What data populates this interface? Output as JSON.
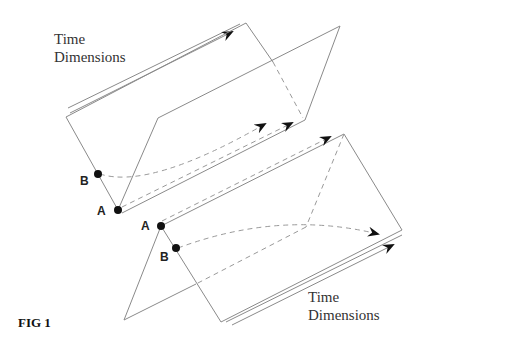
{
  "figure": {
    "caption": "FIG 1",
    "top_label_line1": "Time",
    "top_label_line2": "Dimensions",
    "bottom_label_line1": "Time",
    "bottom_label_line2": "Dimensions",
    "points": {
      "top_b": "B",
      "top_a": "A",
      "bottom_a": "A",
      "bottom_b": "B"
    },
    "colors": {
      "line": "#8a8a8a",
      "dash": "#9a9a9a",
      "point": "#111111",
      "arrow": "#111111"
    }
  }
}
